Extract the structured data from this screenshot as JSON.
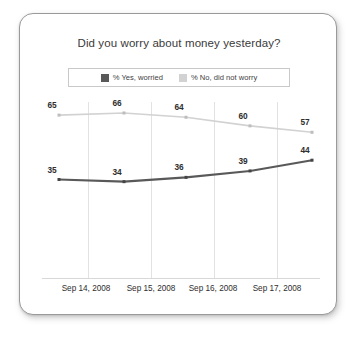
{
  "chart_data": {
    "type": "line",
    "title": "Did you worry about money yesterday?",
    "xlabel": "",
    "ylabel": "",
    "grid": true,
    "legend_position": "top-center",
    "categories": [
      "Sep 14, 2008",
      "Sep 15, 2008",
      "Sep 16, 2008",
      "Sep 17, 2008",
      ""
    ],
    "tick_labels": [
      "Sep 14, 2008",
      "Sep 15, 2008",
      "Sep 16, 2008",
      "Sep 17, 2008"
    ],
    "ylim": [
      0,
      100
    ],
    "series": [
      {
        "name": "% Yes, worried",
        "color": "#595959",
        "values": [
          35,
          34,
          36,
          39,
          44
        ]
      },
      {
        "name": "% No, did not worry",
        "color": "#d2d2d2",
        "values": [
          65,
          66,
          64,
          60,
          57
        ]
      }
    ]
  },
  "legend": {
    "items": [
      {
        "label": "% Yes, worried",
        "color": "#595959"
      },
      {
        "label": "% No, did not worry",
        "color": "#d2d2d2"
      }
    ]
  },
  "colors": {
    "yes_series": "#595959",
    "no_series": "#d2d2d2",
    "gridline": "#e2e2e2",
    "axis": "#d8d8d8",
    "card_border": "#9a9a9a",
    "title_text": "#3a3a3a",
    "label_text": "#2e2e2e"
  }
}
